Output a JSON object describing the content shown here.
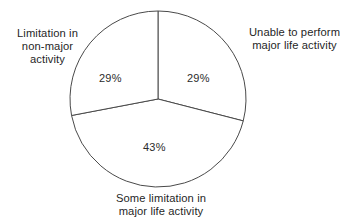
{
  "chart_data": {
    "type": "pie",
    "title": "",
    "subtitle": "",
    "xlabel": "",
    "ylabel": "",
    "legend_position": "outside-callout",
    "grid": false,
    "units": "percent",
    "total": 101,
    "categories": [
      "Unable to perform major life activity",
      "Some limitation in major life activity",
      "Limitation in non-major activity"
    ],
    "values": [
      29,
      43,
      29
    ],
    "value_labels": [
      "29%",
      "43%",
      "29%"
    ],
    "slices": [
      {
        "name": "unable-to-perform",
        "value": 29,
        "value_label": "29%",
        "label_lines": [
          "Unable to perform",
          "major life activity"
        ],
        "label_position": "right",
        "start_angle_deg": 0,
        "end_angle_deg": 104.4,
        "fill": "#ffffff"
      },
      {
        "name": "some-limitation",
        "value": 43,
        "value_label": "43%",
        "label_lines": [
          "Some limitation in",
          "major life activity"
        ],
        "label_position": "bottom",
        "start_angle_deg": 104.4,
        "end_angle_deg": 259.2,
        "fill": "#ffffff"
      },
      {
        "name": "limitation-non-major",
        "value": 29,
        "value_label": "29%",
        "label_lines": [
          "Limitation in",
          "non-major",
          "activity"
        ],
        "label_position": "left",
        "start_angle_deg": 259.2,
        "end_angle_deg": 360,
        "fill": "#ffffff"
      }
    ],
    "geometry": {
      "center_x": 158,
      "center_y": 99,
      "radius": 88
    },
    "style": {
      "stroke": "#4a4a4a",
      "stroke_width": 1,
      "background": "#ffffff",
      "text_color": "#1f1f1f"
    }
  },
  "labels": {
    "left": {
      "line1": "Limitation in",
      "line2": "non-major",
      "line3": "activity"
    },
    "right": {
      "line1": "Unable to perform",
      "line2": "major life activity"
    },
    "bottom": {
      "line1": "Some limitation in",
      "line2": "major life activity"
    }
  },
  "percentages": {
    "left": "29%",
    "right": "29%",
    "bottom": "43%"
  }
}
